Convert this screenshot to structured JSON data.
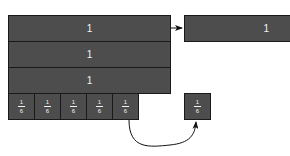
{
  "diagram": {
    "whole_bars": [
      {
        "label": "1"
      },
      {
        "label": "1"
      },
      {
        "label": "1"
      }
    ],
    "sixths": [
      {
        "numerator": "1",
        "denominator": "6"
      },
      {
        "numerator": "1",
        "denominator": "6"
      },
      {
        "numerator": "1",
        "denominator": "6"
      },
      {
        "numerator": "1",
        "denominator": "6"
      },
      {
        "numerator": "1",
        "denominator": "6"
      }
    ],
    "moved_bar": {
      "label": "1"
    },
    "moved_sixth": {
      "numerator": "1",
      "denominator": "6"
    },
    "colors": {
      "block": "#4d4d4d",
      "border": "#1a1a1a",
      "text": "#f2f2f2",
      "arrow": "#111111"
    }
  }
}
